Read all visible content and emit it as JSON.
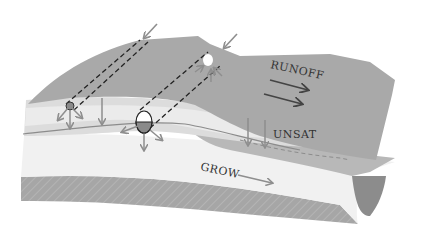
{
  "diagram": {
    "labels": {
      "runoff": "RUNOFF",
      "unsat": "UNSAT",
      "grow": "GROW"
    },
    "colors": {
      "surface": "#a8a8a8",
      "surface_edge": "#9a9a9a",
      "top_soil_light": "#d6d6d6",
      "top_soil_band": "#e4e4e4",
      "unsat_zone": "#efefef",
      "lower_band": "#bdbdbd",
      "bedrock_band": "#a4a4a4",
      "channel": "#8c8c8c",
      "arrow_gray": "#8e8e8e",
      "arrow_dark": "#444444",
      "dashed": "#222222",
      "text": "#333333"
    }
  }
}
